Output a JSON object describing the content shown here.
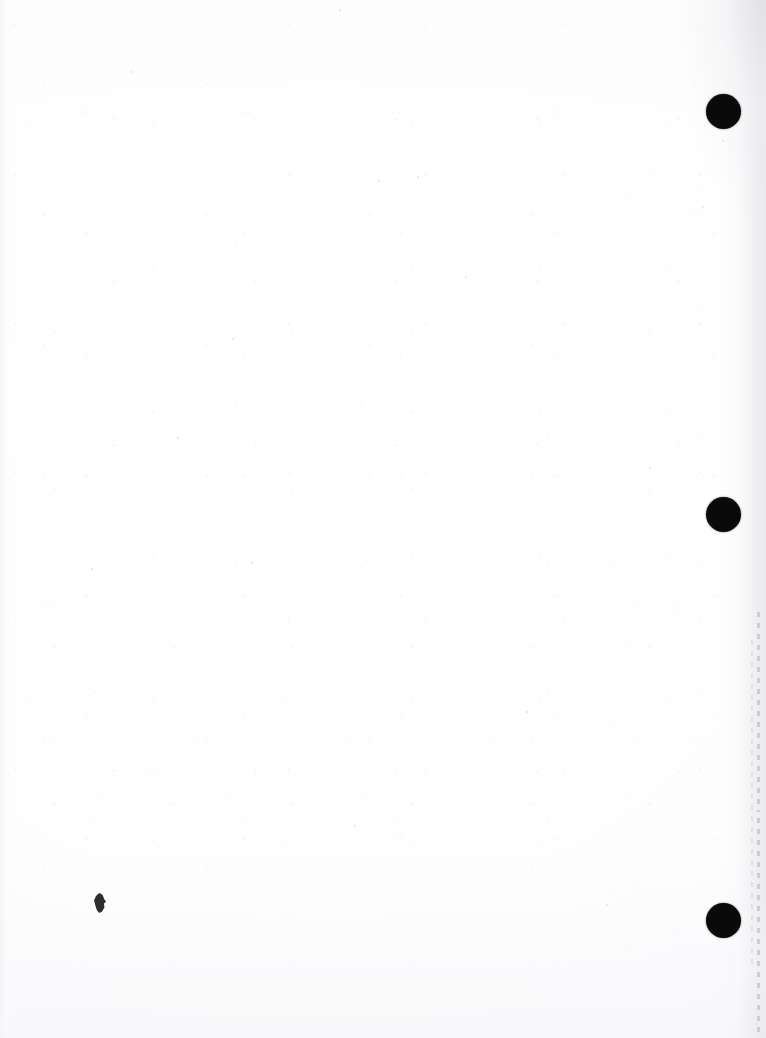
{
  "document": {
    "kind": "scanned-blank-page",
    "page_label": "",
    "visible_text": "",
    "width_px": 766,
    "height_px": 1038,
    "background_color": "#ffffff",
    "ink_color": "#0a0a0a"
  },
  "marks": {
    "hole_punch_label": "",
    "holes": [
      {
        "name": "hole-top",
        "cx": 723,
        "cy": 111,
        "d": 35
      },
      {
        "name": "hole-middle",
        "cx": 723,
        "cy": 514,
        "d": 35
      },
      {
        "name": "hole-bottom",
        "cx": 723,
        "cy": 920,
        "d": 35
      }
    ],
    "ink_blot": {
      "name": "ink-blot",
      "x": 93,
      "y": 893,
      "w": 13,
      "h": 20
    }
  },
  "edges": {
    "right_shadow_color": "#e8e8ed",
    "left_shadow_color": "#f4f4f7",
    "perforation_color": "#b0b0b8",
    "perforation_segments": [
      {
        "name": "perforation-upper",
        "x": 757,
        "y": 612,
        "h": 200
      },
      {
        "name": "perforation-lower",
        "x": 757,
        "y": 818,
        "h": 220
      },
      {
        "name": "perforation-faint",
        "x": 751,
        "y": 640,
        "h": 330
      }
    ]
  },
  "speckles": [
    {
      "x": 131,
      "y": 72,
      "r": 1.4
    },
    {
      "x": 340,
      "y": 10,
      "r": 1.2
    },
    {
      "x": 703,
      "y": 207,
      "r": 1.3
    },
    {
      "x": 723,
      "y": 141,
      "r": 1.1
    },
    {
      "x": 379,
      "y": 181,
      "r": 1.0
    },
    {
      "x": 418,
      "y": 177,
      "r": 1.1
    },
    {
      "x": 355,
      "y": 826,
      "r": 1.2
    },
    {
      "x": 92,
      "y": 569,
      "r": 1.1
    },
    {
      "x": 252,
      "y": 563,
      "r": 1.0
    },
    {
      "x": 650,
      "y": 468,
      "r": 1.1
    },
    {
      "x": 233,
      "y": 339,
      "r": 1.0
    },
    {
      "x": 527,
      "y": 712,
      "r": 1.0
    },
    {
      "x": 607,
      "y": 905,
      "r": 1.1
    },
    {
      "x": 178,
      "y": 438,
      "r": 0.9
    },
    {
      "x": 466,
      "y": 277,
      "r": 0.9
    }
  ]
}
